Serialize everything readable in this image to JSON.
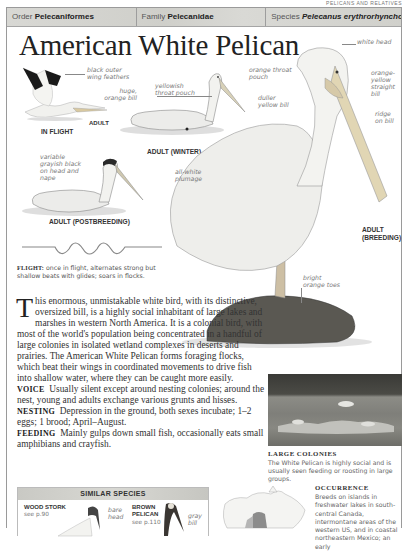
{
  "running_head": "PELICANS AND RELATIVES",
  "taxonomy": {
    "order_label": "Order",
    "order_value": "Pelecaniformes",
    "family_label": "Family",
    "family_value": "Pelecanidae",
    "species_label": "Species",
    "species_value": "Pelecanus erythrorhynchos"
  },
  "title": "American White Pelican",
  "illustrations": {
    "in_flight": {
      "caption": "IN FLIGHT",
      "sub_caption": "ADULT",
      "annotations": [
        "black outer wing feathers",
        "huge, orange bill"
      ]
    },
    "adult_winter": {
      "caption": "ADULT (WINTER)",
      "annotations": [
        "yellowish throat pouch",
        "duller yellow bill"
      ]
    },
    "adult_postbreeding": {
      "caption": "ADULT (POSTBREEDING)",
      "annotations": [
        "variable grayish black on head and nape"
      ]
    },
    "adult_breeding": {
      "caption_line1": "ADULT",
      "caption_line2": "(BREEDING)",
      "annotations": [
        "white head",
        "orange throat pouch",
        "orange-yellow straight bill",
        "ridge on bill",
        "all-white plumage",
        "bright orange toes"
      ]
    }
  },
  "annotations": {
    "black_outer_wing": "black outer wing feathers",
    "huge_bill": "huge, orange bill",
    "yellowish_pouch": "yellowish throat pouch",
    "orange_pouch": "orange throat pouch",
    "duller_bill": "duller yellow bill",
    "white_head": "white head",
    "orange_yellow_bill": "orange-yellow straight bill",
    "ridge": "ridge on bill",
    "grayish_head": "variable grayish black on head and nape",
    "all_white": "all-white plumage",
    "orange_toes": "bright orange toes"
  },
  "flight": {
    "label": "FLIGHT:",
    "text": "once in flight, alternates strong but shallow beats with glides; soars in flocks."
  },
  "description": {
    "dropcap": "T",
    "intro": "his enormous, unmistakable white bird, with its distinctive, oversized bill, is a highly social inhabitant of large lakes and marshes in western North America. It is a colonial bird, with most of the world's population being concentrated in a handful of large colonies in isolated wetland complexes in deserts and prairies. The American White Pelican forms foraging flocks, which beat their wings in coordinated movements to drive fish into shallow water, where they can be caught more easily.",
    "voice_label": "VOICE",
    "voice_text": "Usually silent except around nesting colonies; around the nest, young and adults exchange various grunts and hisses.",
    "nesting_label": "NESTING",
    "nesting_text": "Depression in the ground, both sexes incubate; 1–2 eggs; 1 brood; April–August.",
    "feeding_label": "FEEDING",
    "feeding_text": "Mainly gulps down small fish, occasionally eats small amphibians and crayfish."
  },
  "large_colonies": {
    "title": "LARGE COLONIES",
    "text": "The White Pelican is highly social and is usually seen feeding or roosting in large groups."
  },
  "similar_species": {
    "title": "SIMILAR SPECIES",
    "items": [
      {
        "name_line1": "WOOD STORK",
        "name_line2": "",
        "ref": "see p.90",
        "annotation": "bare head"
      },
      {
        "name_line1": "BROWN",
        "name_line2": "PELICAN",
        "ref": "see p.110",
        "annotation": "gray bill"
      }
    ]
  },
  "occurrence": {
    "title": "OCCURRENCE",
    "text": "Breeds on islands in freshwater lakes in south-central Canada, intermontane areas of the western US, and in coastal northeastern Mexico; an early"
  }
}
